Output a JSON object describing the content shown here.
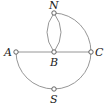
{
  "diagram": {
    "type": "graph",
    "nodes": [
      {
        "id": "N",
        "label": "N"
      },
      {
        "id": "A",
        "label": "A"
      },
      {
        "id": "B",
        "label": "B"
      },
      {
        "id": "C",
        "label": "C"
      },
      {
        "id": "S",
        "label": "S"
      }
    ],
    "edges": [
      {
        "from": "N",
        "to": "B",
        "shape": "arc-left"
      },
      {
        "from": "N",
        "to": "B",
        "shape": "arc-right"
      },
      {
        "from": "A",
        "to": "B",
        "shape": "straight"
      },
      {
        "from": "B",
        "to": "C",
        "shape": "straight"
      },
      {
        "from": "N",
        "to": "C",
        "shape": "arc"
      },
      {
        "from": "A",
        "to": "S",
        "shape": "arc"
      },
      {
        "from": "S",
        "to": "C",
        "shape": "arc"
      }
    ],
    "colors": {
      "edge": "#8a8a8a",
      "node_stroke": "#555555",
      "label": "#222222"
    }
  }
}
